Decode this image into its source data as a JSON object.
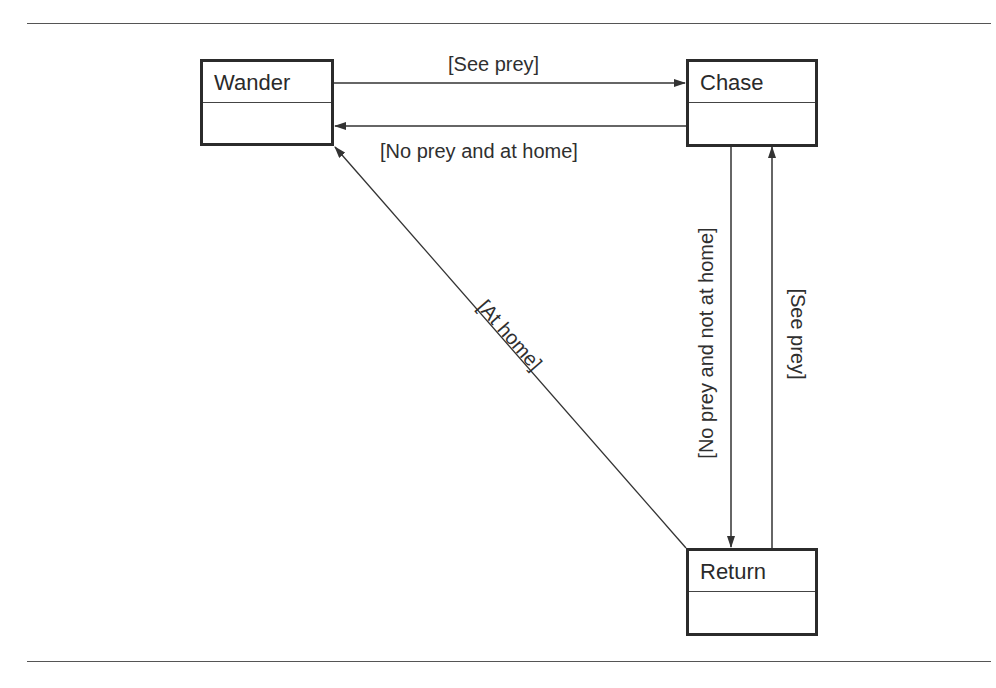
{
  "diagram": {
    "type": "state-machine",
    "states": [
      {
        "id": "wander",
        "label": "Wander"
      },
      {
        "id": "chase",
        "label": "Chase"
      },
      {
        "id": "return",
        "label": "Return"
      }
    ],
    "transitions": [
      {
        "from": "wander",
        "to": "chase",
        "label": "[See prey]"
      },
      {
        "from": "chase",
        "to": "wander",
        "label": "[No prey and at home]"
      },
      {
        "from": "return",
        "to": "wander",
        "label": "[At home]"
      },
      {
        "from": "chase",
        "to": "return",
        "label": "[No prey and not at home]"
      },
      {
        "from": "return",
        "to": "chase",
        "label": "[See prey]"
      }
    ],
    "colors": {
      "line": "#333333",
      "box_border": "#2b2b2b",
      "text": "#2a2a2a",
      "background": "#ffffff"
    }
  }
}
